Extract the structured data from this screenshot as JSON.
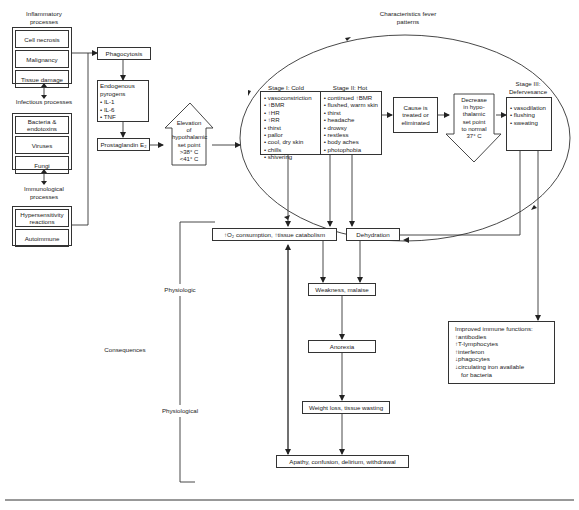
{
  "inputs": {
    "inflammatory": {
      "title": "Inflammatory processes",
      "items": [
        "Cell necrosis",
        "Malignancy",
        "Tissue damage"
      ]
    },
    "infectious": {
      "title": "Infectious processes",
      "items": [
        "Bacteria & endotoxins",
        "Viruses",
        "Fungi"
      ]
    },
    "immunological": {
      "title": "Immunological processes",
      "items": [
        "Hypersensitivity reactions",
        "Autoimmune"
      ]
    }
  },
  "pathway": {
    "phagocytosis": "Phagocytosis",
    "pyrogens": {
      "title": "Endogenous pyrogens",
      "items": [
        "• IL-1",
        "• IL-6",
        "• TNF"
      ]
    },
    "prostaglandin": "Prostaglandin E₂",
    "elevation": {
      "lines": [
        "Elevation",
        "of",
        "hypothalamic",
        "set point",
        ">38° C",
        "<41° C"
      ]
    }
  },
  "fever_patterns": {
    "title": "Characteristics fever patterns",
    "stage1": {
      "title": "Stage I: Cold",
      "items": [
        "• vasoconstriction",
        "• ↑BMR",
        "• ↑HR",
        "• ↑RR",
        "• thirst",
        "• pallor",
        "• cool, dry skin",
        "• chills",
        "• shivering"
      ]
    },
    "stage2": {
      "title": "Stage II: Hot",
      "items": [
        "• continued ↑BMR",
        "• flushed, warm skin",
        "• thirst",
        "• headache",
        "• drowsy",
        "• restless",
        "• body aches",
        "• photophobia"
      ]
    },
    "cause": "Cause is treated or eliminated",
    "decrease": {
      "lines": [
        "Decrease",
        "in hypo-",
        "thalamic",
        "set point",
        "to normal",
        "37° C"
      ]
    },
    "stage3": {
      "title": "Stage III: Defervesance",
      "items": [
        "• vasodilation",
        "• flushing",
        "• sweating"
      ]
    }
  },
  "consequences": {
    "label": "Consequences",
    "physiologic_label": "Physiologic",
    "physiological_label": "Physiological",
    "o2": "↑O₂ consumption, ↑tissue catabolism",
    "dehydration": "Dehydration",
    "weakness": "Weakness, malaise",
    "anorexia": "Anorexia",
    "weight_loss": "Weight loss, tissue wasting",
    "apathy": "Apathy, confusion, delirium, withdrawal",
    "immune": {
      "title": "Improved immune functions:",
      "items": [
        "↑antibodies",
        "↑T-lymphocytes",
        "↑interferon",
        "↓phagocytes",
        "↓circulating iron available",
        "  for bacteria"
      ]
    }
  },
  "colors": {
    "line": "#333333",
    "background": "#ffffff",
    "text": "#1a1a1a"
  }
}
